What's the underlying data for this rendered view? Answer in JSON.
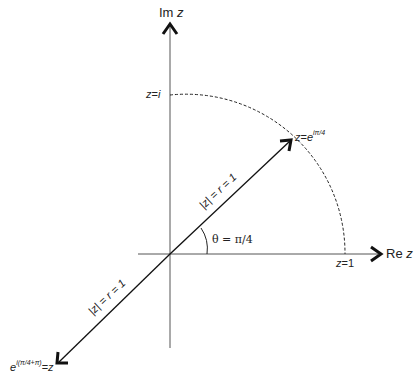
{
  "diagram": {
    "type": "complex-plane-argand",
    "axes": {
      "imag_label": "Im z",
      "imag_prefix": "Im",
      "imag_var": "z",
      "real_label": "Re z",
      "real_prefix": "Re",
      "real_var": "z"
    },
    "points": {
      "z_i": {
        "label": "z = i",
        "lhs": "z",
        "eq": "=",
        "rhs": "i"
      },
      "z_1": {
        "label": "z = 1",
        "lhs": "z",
        "eq": "=",
        "rhs": "1"
      },
      "z_e_pi4": {
        "label": "z = e^{iπ/4}",
        "lhs": "z",
        "eq": "=",
        "base": "e",
        "exp": "iπ/4"
      },
      "z_e_pi4_plus_pi": {
        "label": "e^{i(π/4+π)} = z",
        "base": "e",
        "exp": "i(π/4+π)",
        "eq": "=",
        "rhs": "z"
      }
    },
    "vectors": [
      {
        "name": "upper-vector",
        "label": "|z| = r = 1",
        "direction_deg": 45
      },
      {
        "name": "lower-vector",
        "label": "|z| = r = 1",
        "direction_deg": 225
      }
    ],
    "angle": {
      "label": "θ = π/4"
    },
    "arc": {
      "style": "dashed",
      "from": "z = 1",
      "to": "z = i",
      "radius": 1
    },
    "colors": {
      "line": "#222222",
      "axis": "#555555",
      "background": "#ffffff"
    }
  }
}
